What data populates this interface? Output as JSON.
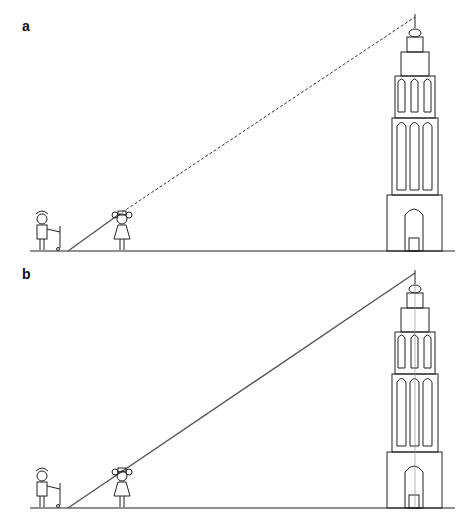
{
  "figure": {
    "panels": [
      {
        "label": "a",
        "sight_line_style": "dashed"
      },
      {
        "label": "b",
        "sight_line_style": "solid"
      }
    ]
  }
}
